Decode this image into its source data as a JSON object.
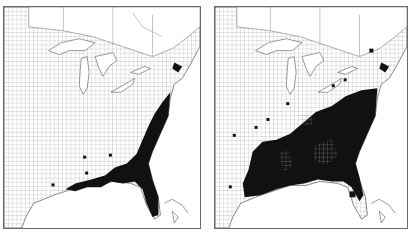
{
  "figure": {
    "panels": [
      {
        "id": "left",
        "label": "Distribution map A",
        "region": "Eastern United States (county boundaries)",
        "shaded_area": "Atlantic and Gulf coastal plain: coastal Virginia, North Carolina, South Carolina, Georgia, Florida, southern Alabama, Mississippi and Louisiana coast",
        "scattered_counties": "a few isolated counties in Mississippi, Alabama and Georgia"
      },
      {
        "id": "right",
        "label": "Distribution map B",
        "region": "Eastern United States (county boundaries)",
        "shaded_area": "Most of the Southeast: Virginia, Carolinas, Georgia, Alabama, Mississippi, Louisiana, eastern Texas, Arkansas, Tennessee, northern Florida",
        "scattered_counties": "isolated counties in Kentucky, Missouri, Ohio, Pennsylvania, New York"
      }
    ],
    "colors": {
      "shaded": "#111111",
      "background": "#ffffff",
      "boundary": "#6a6a6a",
      "county_grid": "#9a9a9a"
    }
  }
}
